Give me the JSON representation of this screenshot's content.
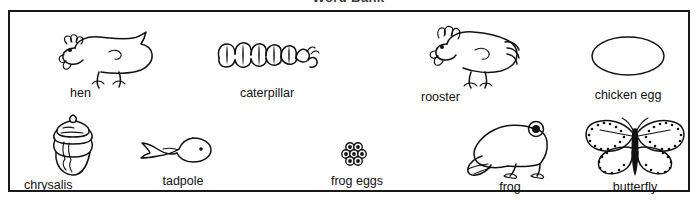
{
  "worksheet": {
    "title": "Word Bank",
    "box_border_color": "#1a1a1a",
    "ink_color": "#111111",
    "background_color": "#ffffff"
  },
  "word_bank": {
    "rows": [
      {
        "row_name": "top-row",
        "items": [
          {
            "label": "hen",
            "icon": "hen-drawing"
          },
          {
            "label": "caterpillar",
            "icon": "caterpillar-drawing"
          },
          {
            "label": "rooster",
            "icon": "rooster-drawing"
          },
          {
            "label": "chicken egg",
            "icon": "chicken-egg-drawing"
          }
        ]
      },
      {
        "row_name": "bottom-row",
        "items": [
          {
            "label": "chrysalis",
            "icon": "chrysalis-drawing"
          },
          {
            "label": "tadpole",
            "icon": "tadpole-drawing"
          },
          {
            "label": "frog eggs",
            "icon": "frog-eggs-drawing"
          },
          {
            "label": "frog",
            "icon": "frog-drawing"
          },
          {
            "label": "butterfly",
            "icon": "butterfly-drawing"
          }
        ]
      }
    ],
    "all_words": [
      "hen",
      "caterpillar",
      "rooster",
      "chicken egg",
      "chrysalis",
      "tadpole",
      "frog eggs",
      "frog",
      "butterfly"
    ]
  }
}
